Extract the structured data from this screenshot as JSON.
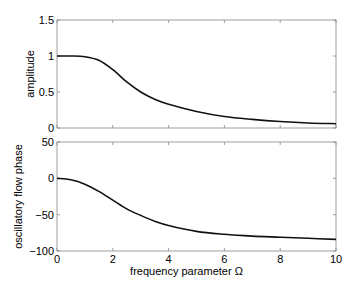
{
  "chart_data": [
    {
      "type": "line",
      "title": "",
      "xlabel": "",
      "ylabel": "amplitude",
      "xlim": [
        0,
        10
      ],
      "ylim": [
        0,
        1.5
      ],
      "xticks": [
        "0",
        "2",
        "4",
        "6",
        "8",
        "10"
      ],
      "yticks": [
        "0",
        "0.5",
        "1",
        "1.5"
      ],
      "grid": false,
      "legend": null,
      "series": [
        {
          "name": "amplitude",
          "x": [
            0,
            0.5,
            1.0,
            1.5,
            2.0,
            2.5,
            3.0,
            3.5,
            4.0,
            5.0,
            6.0,
            7.0,
            8.0,
            9.0,
            10.0
          ],
          "values": [
            1.0,
            1.0,
            0.99,
            0.94,
            0.81,
            0.64,
            0.5,
            0.4,
            0.33,
            0.23,
            0.16,
            0.12,
            0.09,
            0.07,
            0.06
          ]
        }
      ]
    },
    {
      "type": "line",
      "title": "",
      "xlabel": "frequency parameter Ω",
      "ylabel": "oscillatory flow phase",
      "xlim": [
        0,
        10
      ],
      "ylim": [
        -100,
        50
      ],
      "xticks": [
        "0",
        "2",
        "4",
        "6",
        "8",
        "10"
      ],
      "yticks": [
        "-100",
        "-50",
        "0",
        "50"
      ],
      "grid": false,
      "legend": null,
      "series": [
        {
          "name": "phase",
          "x": [
            0,
            0.5,
            1.0,
            1.5,
            2.0,
            2.5,
            3.0,
            3.5,
            4.0,
            5.0,
            6.0,
            7.0,
            8.0,
            9.0,
            10.0
          ],
          "values": [
            0,
            -2,
            -8,
            -18,
            -30,
            -42,
            -51,
            -59,
            -65,
            -73,
            -77,
            -79.5,
            -81,
            -82.5,
            -84
          ]
        }
      ]
    }
  ]
}
